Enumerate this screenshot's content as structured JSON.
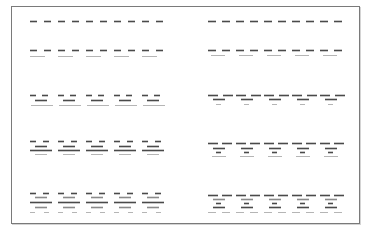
{
  "diagram": {
    "frame": {
      "x": 11,
      "y": 6,
      "width": 349,
      "height": 218,
      "color": "#7a7a7a"
    },
    "colors": {
      "dark": "#4a4a4a",
      "mid": "#8a8a8a",
      "light": "#b5b5b5"
    },
    "columns": [
      {
        "name": "left",
        "unit_starts": [
          30,
          58,
          86,
          114,
          142
        ],
        "unit_width": 24,
        "rows": [
          {
            "y": 21,
            "layers": [
              {
                "type": "pair",
                "dy": 0,
                "len": 7,
                "gap": 7,
                "tone": "dark"
              }
            ]
          },
          {
            "y": 50,
            "layers": [
              {
                "type": "pair",
                "dy": 0,
                "len": 7,
                "gap": 7,
                "tone": "dark"
              },
              {
                "type": "single",
                "dy": 6,
                "len": 15,
                "offset": 0,
                "tone": "light"
              }
            ]
          },
          {
            "y": 95,
            "layers": [
              {
                "type": "pair",
                "dy": 0,
                "len": 6,
                "gap": 6,
                "tone": "dark"
              },
              {
                "type": "single",
                "dy": 5,
                "len": 12,
                "offset": 5,
                "tone": "dark"
              },
              {
                "type": "single",
                "dy": 10,
                "len": 22,
                "offset": 1,
                "tone": "light"
              }
            ]
          },
          {
            "y": 141,
            "layers": [
              {
                "type": "pair",
                "dy": 0,
                "len": 6,
                "gap": 7,
                "tone": "dark"
              },
              {
                "type": "single",
                "dy": 5,
                "len": 12,
                "offset": 5,
                "tone": "dark"
              },
              {
                "type": "single",
                "dy": 9,
                "len": 22,
                "offset": 0,
                "tone": "dark"
              },
              {
                "type": "single",
                "dy": 13,
                "len": 12,
                "offset": 5,
                "tone": "light"
              }
            ]
          },
          {
            "y": 193,
            "layers": [
              {
                "type": "pair",
                "dy": 0,
                "len": 6,
                "gap": 7,
                "tone": "dark"
              },
              {
                "type": "single",
                "dy": 4,
                "len": 12,
                "offset": 5,
                "tone": "mid"
              },
              {
                "type": "single",
                "dy": 9,
                "len": 22,
                "offset": 0,
                "tone": "dark"
              },
              {
                "type": "single",
                "dy": 14,
                "len": 12,
                "offset": 5,
                "tone": "mid"
              },
              {
                "type": "pair",
                "dy": 19,
                "len": 5,
                "gap": 9,
                "tone": "light"
              }
            ]
          }
        ]
      },
      {
        "name": "right",
        "unit_starts": [
          208,
          236,
          264,
          292,
          320
        ],
        "unit_width": 26,
        "rows": [
          {
            "y": 21,
            "layers": [
              {
                "type": "pair",
                "dy": 0,
                "len": 8,
                "gap": 6,
                "tone": "dark"
              }
            ]
          },
          {
            "y": 50,
            "layers": [
              {
                "type": "pair",
                "dy": 0,
                "len": 8,
                "gap": 6,
                "tone": "dark"
              },
              {
                "type": "single",
                "dy": 5,
                "len": 14,
                "offset": 3,
                "tone": "light"
              }
            ]
          },
          {
            "y": 95,
            "layers": [
              {
                "type": "pair",
                "dy": 0,
                "len": 10,
                "gap": 5,
                "tone": "dark"
              },
              {
                "type": "single",
                "dy": 4,
                "len": 12,
                "offset": 5,
                "tone": "dark"
              },
              {
                "type": "single",
                "dy": 9,
                "len": 5,
                "offset": 8,
                "tone": "light"
              }
            ]
          },
          {
            "y": 143,
            "layers": [
              {
                "type": "pair",
                "dy": 0,
                "len": 10,
                "gap": 4,
                "tone": "dark"
              },
              {
                "type": "single",
                "dy": 5,
                "len": 12,
                "offset": 5,
                "tone": "dark"
              },
              {
                "type": "single",
                "dy": 9,
                "len": 5,
                "offset": 8,
                "tone": "dark"
              },
              {
                "type": "single",
                "dy": 13,
                "len": 14,
                "offset": 4,
                "tone": "light"
              }
            ]
          },
          {
            "y": 195,
            "layers": [
              {
                "type": "pair",
                "dy": 0,
                "len": 10,
                "gap": 4,
                "tone": "dark"
              },
              {
                "type": "single",
                "dy": 4,
                "len": 12,
                "offset": 5,
                "tone": "mid"
              },
              {
                "type": "single",
                "dy": 8,
                "len": 5,
                "offset": 8,
                "tone": "dark"
              },
              {
                "type": "single",
                "dy": 12,
                "len": 12,
                "offset": 5,
                "tone": "dark"
              },
              {
                "type": "pair",
                "dy": 17,
                "len": 8,
                "gap": 6,
                "tone": "light"
              }
            ]
          }
        ]
      }
    ]
  }
}
